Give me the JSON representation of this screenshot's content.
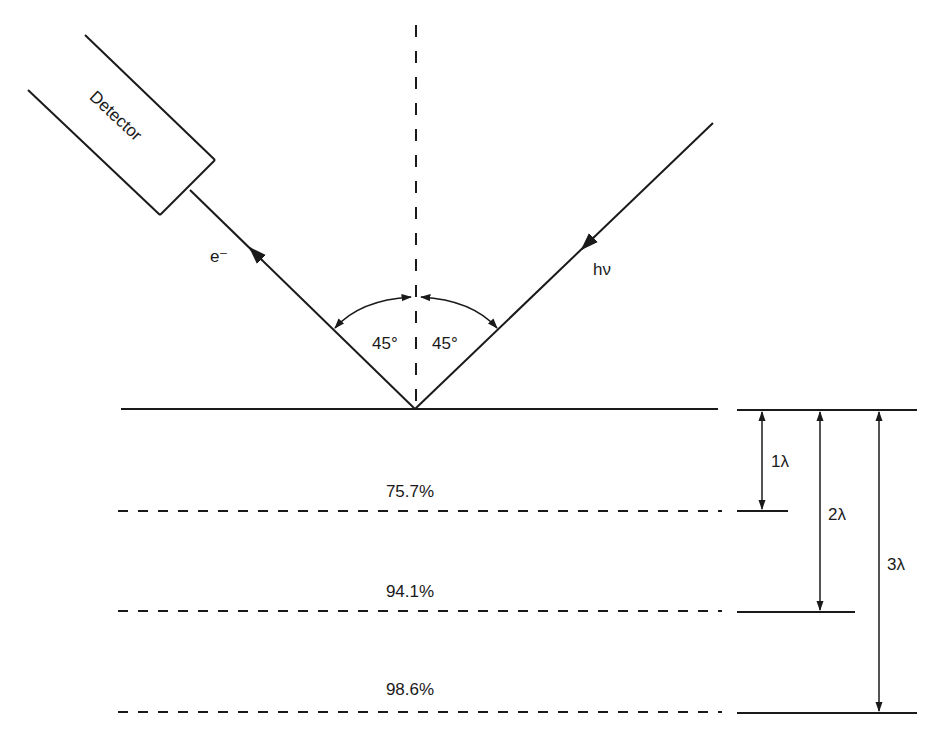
{
  "diagram": {
    "detector_label": "Detector",
    "electron_label": "e⁻",
    "photon_label": "hν",
    "angle_left_label": "45°",
    "angle_right_label": "45°",
    "depth_levels": [
      {
        "percent": "75.7%",
        "depth_label": "1λ"
      },
      {
        "percent": "94.1%",
        "depth_label": "2λ"
      },
      {
        "percent": "98.6%",
        "depth_label": "3λ"
      }
    ],
    "colors": {
      "line": "#1a1a1a",
      "background": "#ffffff"
    }
  }
}
